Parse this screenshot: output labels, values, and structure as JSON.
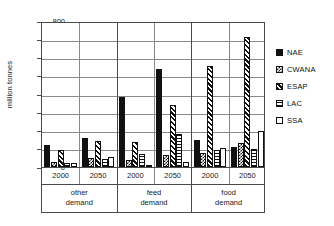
{
  "chart_data": {
    "type": "bar",
    "title": "",
    "subtitle": "",
    "xlabel": "",
    "ylabel": "million tonnes",
    "ylim": [
      0,
      800
    ],
    "yticks": [
      0,
      100,
      200,
      300,
      400,
      500,
      600,
      700,
      800
    ],
    "grid": true,
    "legend_position": "right",
    "groups": [
      "other demand",
      "feed demand",
      "food demand"
    ],
    "years": [
      "2000",
      "2050"
    ],
    "categories": [
      "other demand 2000",
      "other demand 2050",
      "feed demand 2000",
      "feed demand 2050",
      "food demand 2000",
      "food demand 2050"
    ],
    "series": [
      {
        "name": "NAE",
        "pattern": "solid-black",
        "values": [
          120,
          160,
          385,
          535,
          150,
          110
        ]
      },
      {
        "name": "CWANA",
        "pattern": "checker",
        "values": [
          25,
          50,
          40,
          65,
          75,
          130
        ]
      },
      {
        "name": "ESAP",
        "pattern": "diagonal-hatch",
        "values": [
          95,
          140,
          135,
          340,
          555,
          710
        ]
      },
      {
        "name": "LAC",
        "pattern": "horizontal-lines",
        "values": [
          20,
          45,
          70,
          180,
          95,
          100
        ]
      },
      {
        "name": "SSA",
        "pattern": "white-empty",
        "values": [
          22,
          55,
          12,
          25,
          105,
          195
        ]
      }
    ]
  },
  "axis": {
    "y_title": "million tonnes",
    "y_tick_labels": [
      "800",
      "700",
      "600",
      "500",
      "400",
      "300",
      "200",
      "100",
      "0"
    ],
    "x_year_labels": [
      "2000",
      "2050",
      "2000",
      "2050",
      "2000",
      "2050"
    ],
    "x_group_labels": [
      "other demand",
      "feed demand",
      "food demand"
    ]
  },
  "legend": {
    "items": [
      {
        "label": "NAE",
        "swatch": "solid-black-swatch"
      },
      {
        "label": "CWANA",
        "swatch": "checker-swatch"
      },
      {
        "label": "ESAP",
        "swatch": "diagonal-hatch-swatch"
      },
      {
        "label": "LAC",
        "swatch": "horizontal-lines-swatch"
      },
      {
        "label": "SSA",
        "swatch": "white-empty-swatch"
      }
    ]
  },
  "colors": {
    "ink": "#111111",
    "grid": "#8a8a8a",
    "frame": "#4a4a4a",
    "background": "#ffffff"
  }
}
